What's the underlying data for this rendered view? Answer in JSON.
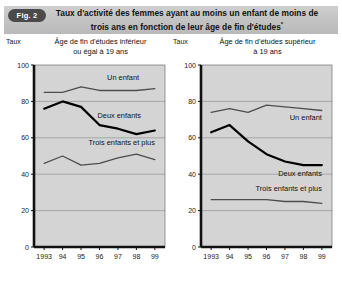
{
  "figure": {
    "badge": "Fig. 2",
    "title_line1": "Taux d'activité des femmes ayant au moins un enfant de moins de",
    "title_line2": "trois ans en fonction de leur âge de fin d'études",
    "title_footnote_marker": "*"
  },
  "panels": [
    {
      "axis_unit": "Taux",
      "subtitle_line1": "Âge de fin d'études inférieur",
      "subtitle_line2": "ou égal à 19 ans"
    },
    {
      "axis_unit": "Taux",
      "subtitle_line1": "Âge de fin d'études supérieur",
      "subtitle_line2": "à 19 ans"
    }
  ],
  "chart_data": [
    {
      "type": "line",
      "title": "Âge de fin d'études inférieur ou égal à 19 ans",
      "xlabel": "",
      "ylabel": "Taux",
      "categories": [
        "1993",
        "94",
        "95",
        "96",
        "97",
        "98",
        "99"
      ],
      "x": [
        1993,
        1994,
        1995,
        1996,
        1997,
        1998,
        1999
      ],
      "ylim": [
        0,
        100
      ],
      "yticks": [
        0,
        20,
        40,
        60,
        80,
        100
      ],
      "grid": true,
      "legend": "inline-labels",
      "series": [
        {
          "name": "Un enfant",
          "values": [
            85,
            85,
            88,
            86,
            86,
            86,
            87
          ]
        },
        {
          "name": "Deux enfants",
          "values": [
            76,
            80,
            77,
            67,
            65,
            62,
            64
          ]
        },
        {
          "name": "Trois enfants et plus",
          "values": [
            46,
            50,
            45,
            46,
            49,
            51,
            48
          ]
        }
      ]
    },
    {
      "type": "line",
      "title": "Âge de fin d'études supérieur à 19 ans",
      "xlabel": "",
      "ylabel": "Taux",
      "categories": [
        "1993",
        "94",
        "95",
        "96",
        "97",
        "98",
        "99"
      ],
      "x": [
        1993,
        1994,
        1995,
        1996,
        1997,
        1998,
        1999
      ],
      "ylim": [
        0,
        100
      ],
      "yticks": [
        0,
        20,
        40,
        60,
        80,
        100
      ],
      "grid": true,
      "legend": "inline-labels",
      "series": [
        {
          "name": "Un enfant",
          "values": [
            74,
            76,
            74,
            78,
            77,
            76,
            75
          ]
        },
        {
          "name": "Deux enfants",
          "values": [
            63,
            67,
            58,
            51,
            47,
            45,
            45
          ]
        },
        {
          "name": "Trois enfants et plus",
          "values": [
            26,
            26,
            26,
            26,
            25,
            25,
            24
          ]
        }
      ]
    }
  ],
  "axis": {
    "y_tick_labels": [
      "100",
      "80",
      "60",
      "40",
      "20",
      "0"
    ],
    "x_tick_labels": [
      "1993",
      "94",
      "95",
      "96",
      "97",
      "98",
      "99"
    ]
  },
  "colors": {
    "plot_background": "#d4d4d4",
    "gridline": "#9a9a9a",
    "axis": "#111111",
    "series_thin": "#4d4d4d",
    "series_thick": "#000000",
    "banner_top": "#cfcfcf",
    "banner_bottom": "#b9b9b9",
    "badge": "#4a4a4a"
  }
}
